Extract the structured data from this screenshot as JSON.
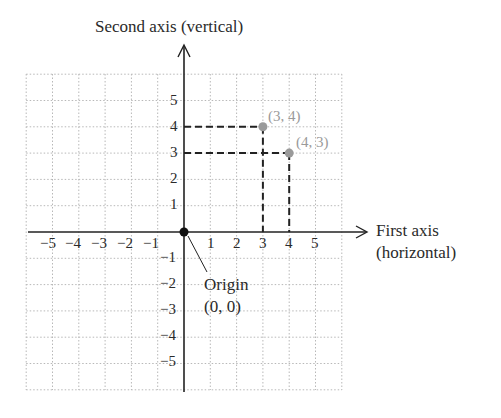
{
  "diagram": {
    "type": "cartesian-coordinate-plane",
    "vertical_axis_title": "Second axis (vertical)",
    "horizontal_axis_title_line1": "First axis",
    "horizontal_axis_title_line2": "(horizontal)",
    "origin_label_line1": "Origin",
    "origin_label_line2": "(0, 0)",
    "x_ticks": [
      "−5",
      "−4",
      "−3",
      "−2",
      "−1",
      "1",
      "2",
      "3",
      "4",
      "5"
    ],
    "y_ticks_positive": [
      "5",
      "4",
      "3",
      "2",
      "1"
    ],
    "y_ticks_negative": [
      "−1",
      "−2",
      "−3",
      "−4",
      "−5"
    ],
    "grid_range": [
      -6,
      6
    ],
    "points": [
      {
        "label": "(3, 4)",
        "x": 3,
        "y": 4
      },
      {
        "label": "(4, 3)",
        "x": 4,
        "y": 3
      }
    ],
    "colors": {
      "axis": "#222222",
      "grid": "#b8b8b8",
      "point": "#9a9a9a",
      "origin_point": "#111111",
      "dashed_guides": "#222222"
    }
  }
}
